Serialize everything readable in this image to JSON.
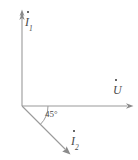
{
  "diagram": {
    "type": "phasor-diagram",
    "stroke_color": "#999999",
    "text_color": "#4a4a4a",
    "background": "#ffffff",
    "origin": {
      "x": 22,
      "y": 106
    },
    "axes": {
      "vertical": {
        "name": "current-axis-i1",
        "label": "I",
        "subscript": "1",
        "overdot": true,
        "from": {
          "x": 22,
          "y": 106
        },
        "to": {
          "x": 22,
          "y": 10
        }
      },
      "horizontal": {
        "name": "voltage-axis-u",
        "label": "U",
        "subscript": "",
        "overdot": true,
        "from": {
          "x": 22,
          "y": 106
        },
        "to": {
          "x": 133,
          "y": 106
        }
      }
    },
    "vectors": [
      {
        "name": "phasor-i2",
        "label": "I",
        "subscript": "2",
        "overdot": true,
        "from": {
          "x": 22,
          "y": 106
        },
        "to": {
          "x": 70,
          "y": 154
        },
        "angle_from_horizontal_deg": -45
      }
    ],
    "angle_arc": {
      "name": "angle-arc-45",
      "label": "45°",
      "value": 45,
      "unit": "degrees",
      "between": [
        "horizontal-axis-u",
        "phasor-i2"
      ],
      "radius": 26
    }
  }
}
